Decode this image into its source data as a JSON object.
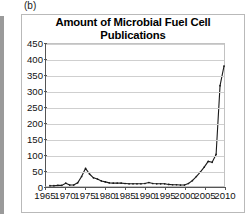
{
  "panel": {
    "label": "(b)"
  },
  "chart_data": {
    "type": "line",
    "title": "Amount of Microbial Fuel Cell Publications per Year",
    "title_line1": "Amount of Microbial Fuel Cell Publications",
    "title_line2": "per Year",
    "xlabel": "",
    "ylabel": "",
    "xlim": [
      1965,
      2010
    ],
    "ylim": [
      0,
      450
    ],
    "grid": true,
    "legend": "none",
    "line_color": "#1a1a1a",
    "xticks": [
      1965,
      1970,
      1975,
      1980,
      1985,
      1990,
      1995,
      2000,
      2005,
      2010
    ],
    "xtick_labels": [
      "1965",
      "1970",
      "1975",
      "1980",
      "1985",
      "1990",
      "1995",
      "2000",
      "2005",
      "2010"
    ],
    "yticks": [
      0,
      50,
      100,
      150,
      200,
      250,
      300,
      350,
      400,
      450
    ],
    "ytick_labels": [
      "0",
      "50",
      "100",
      "150",
      "200",
      "250",
      "300",
      "350",
      "400",
      "450"
    ],
    "x": [
      1966,
      1967,
      1968,
      1969,
      1970,
      1971,
      1972,
      1973,
      1974,
      1975,
      1976,
      1977,
      1978,
      1979,
      1980,
      1981,
      1982,
      1983,
      1984,
      1985,
      1986,
      1987,
      1988,
      1989,
      1990,
      1991,
      1992,
      1993,
      1994,
      1995,
      1996,
      1997,
      1998,
      1999,
      2000,
      2001,
      2002,
      2003,
      2004,
      2005,
      2006,
      2007,
      2008,
      2009,
      2010
    ],
    "values": [
      1,
      1,
      2,
      2,
      9,
      3,
      3,
      10,
      30,
      56,
      38,
      26,
      22,
      16,
      13,
      10,
      9,
      9,
      9,
      8,
      7,
      7,
      7,
      7,
      8,
      11,
      8,
      7,
      7,
      7,
      5,
      4,
      4,
      3,
      3,
      8,
      17,
      30,
      44,
      60,
      78,
      75,
      100,
      318,
      380
    ],
    "series_name": "Microbial Fuel Cell publications"
  }
}
